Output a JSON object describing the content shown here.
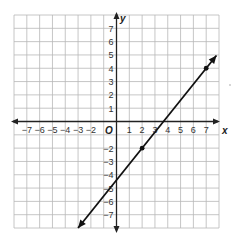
{
  "chart_data": {
    "type": "line",
    "title": "",
    "xlabel": "x",
    "ylabel": "y",
    "origin_label": "O",
    "xlim": [
      -8,
      8
    ],
    "ylim": [
      -8,
      8
    ],
    "grid": true,
    "x_ticks": [
      -7,
      -6,
      -5,
      -4,
      -3,
      -2,
      1,
      2,
      3,
      4,
      5,
      6,
      7
    ],
    "x_tick_labels": [
      "−7",
      "−6",
      "−5",
      "−4",
      "−3",
      "−2",
      "1",
      "2",
      "3",
      "4",
      "5",
      "6",
      "7"
    ],
    "y_ticks": [
      7,
      6,
      5,
      4,
      3,
      2,
      1,
      -2,
      -3,
      -4,
      -5,
      -6,
      -7
    ],
    "y_tick_labels": [
      "7",
      "6",
      "5",
      "4",
      "3",
      "2",
      "1",
      "−2",
      "−3",
      "−4",
      "−5",
      "−6",
      "−7"
    ],
    "series": [
      {
        "name": "line",
        "slope": 1.2,
        "intercept": -4.4,
        "x_range": [
          -3,
          7.8
        ],
        "arrows": "both",
        "marked_points": [
          {
            "x": 2,
            "y": -2
          },
          {
            "x": 7,
            "y": 4
          }
        ]
      }
    ]
  }
}
